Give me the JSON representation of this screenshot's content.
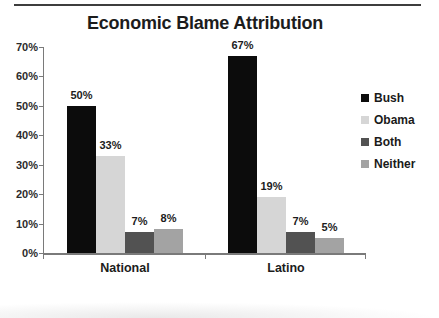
{
  "page": {
    "background": "#ffffff",
    "top_rule_color": "#3d3d3d"
  },
  "chart_data": {
    "type": "bar",
    "title": "Economic Blame Attribution",
    "categories": [
      "National",
      "Latino"
    ],
    "series": [
      {
        "name": "Bush",
        "color": "#0c0c0c",
        "values": [
          50,
          67
        ]
      },
      {
        "name": "Obama",
        "color": "#d6d6d6",
        "values": [
          33,
          19
        ]
      },
      {
        "name": "Both",
        "color": "#525252",
        "values": [
          7,
          7
        ]
      },
      {
        "name": "Neither",
        "color": "#a3a3a3",
        "values": [
          8,
          5
        ]
      }
    ],
    "data_labels": [
      "50%",
      "33%",
      "7%",
      "8%",
      "67%",
      "19%",
      "7%",
      "5%"
    ],
    "xlabel": "",
    "ylabel": "",
    "ylim": [
      0,
      70
    ],
    "yticks": [
      "0%",
      "10%",
      "20%",
      "30%",
      "40%",
      "50%",
      "60%",
      "70%"
    ],
    "grid": false,
    "legend_position": "right",
    "axis_color": "#7a7a7a",
    "label_color": "#1c1c1c"
  }
}
